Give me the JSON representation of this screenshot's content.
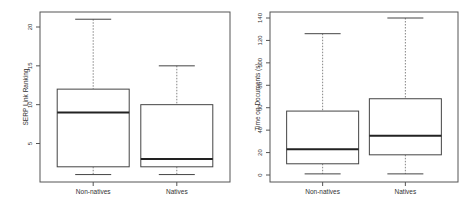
{
  "chart_data": [
    {
      "type": "box",
      "title": "",
      "xlabel": "",
      "ylabel": "SERP Link Ranking",
      "categories": [
        "Non-natives",
        "Natives"
      ],
      "yticks": [
        5,
        10,
        15,
        20
      ],
      "ylim": [
        0,
        22
      ],
      "grid": false,
      "series": [
        {
          "name": "Non-natives",
          "whisker_low": 1,
          "q1": 2,
          "median": 9,
          "q3": 12,
          "whisker_high": 21
        },
        {
          "name": "Natives",
          "whisker_low": 1,
          "q1": 2,
          "median": 3,
          "q3": 10,
          "whisker_high": 15
        }
      ]
    },
    {
      "type": "box",
      "title": "",
      "xlabel": "",
      "ylabel": "Time on Documents (s)",
      "categories": [
        "Non-natives",
        "Natives"
      ],
      "yticks": [
        0,
        20,
        40,
        60,
        80,
        100,
        120,
        140
      ],
      "ylim": [
        -5,
        145
      ],
      "grid": false,
      "series": [
        {
          "name": "Non-natives",
          "whisker_low": 1,
          "q1": 10,
          "median": 23,
          "q3": 57,
          "whisker_high": 126
        },
        {
          "name": "Natives",
          "whisker_low": 1,
          "q1": 18,
          "median": 35,
          "q3": 68,
          "whisker_high": 140
        }
      ]
    }
  ]
}
